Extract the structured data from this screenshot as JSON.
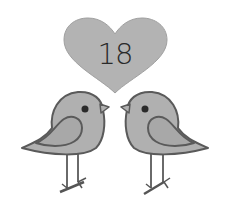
{
  "illustration": {
    "heart": {
      "label": "18",
      "fill": "#b3b3b3",
      "stroke": "#9a9a9a",
      "icon": "heart-icon"
    },
    "birds": [
      {
        "name": "left-bird",
        "facing": "right",
        "icon": "bird-icon"
      },
      {
        "name": "right-bird",
        "facing": "left",
        "icon": "bird-icon"
      }
    ],
    "colors": {
      "background": "#ffffff",
      "body": "#b0b0b0",
      "outline": "#5a5a5a",
      "eye": "#2a2a2a",
      "legs": "#6a6a6a"
    }
  }
}
